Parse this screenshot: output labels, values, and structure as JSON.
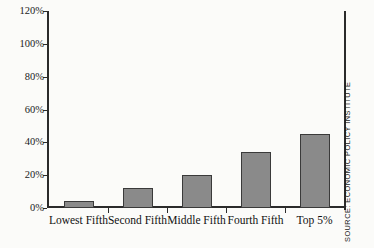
{
  "chart_data": {
    "type": "bar",
    "title": "",
    "xlabel": "",
    "ylabel": "",
    "categories": [
      "Lowest Fifth",
      "Second Fifth",
      "Middle Fifth",
      "Fourth Fifth",
      "Top 5%"
    ],
    "values": [
      4,
      12,
      20,
      34,
      45
    ],
    "ylim": [
      0,
      120
    ],
    "ytick_labels": [
      "0%",
      "20%",
      "40%",
      "60%",
      "80%",
      "100%",
      "120%"
    ],
    "ytick_values": [
      0,
      20,
      40,
      60,
      80,
      100,
      120
    ],
    "grid": false,
    "legend": null,
    "series_color": "#8a8a8a",
    "axis_color": "#2b2b2b",
    "annotations": [
      {
        "name": "source",
        "text": "SOURCE: ECONOMIC POLICY INSTITUTE",
        "position": "right-vertical"
      }
    ]
  }
}
